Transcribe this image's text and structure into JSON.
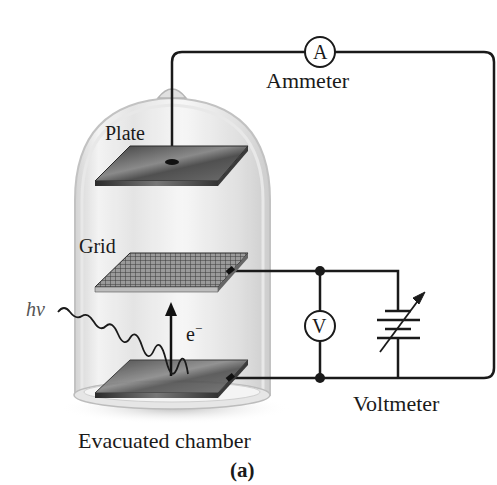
{
  "figure": {
    "caption": "(a)",
    "labels": {
      "ammeter": "Ammeter",
      "ammeter_symbol": "A",
      "plate": "Plate",
      "grid": "Grid",
      "photon": "hν",
      "electron": "e",
      "electron_charge": "−",
      "voltmeter": "Voltmeter",
      "voltmeter_symbol": "V",
      "chamber": "Evacuated chamber"
    },
    "colors": {
      "wire": "#1a1a1a",
      "glass": "#d9d9d9",
      "plate": "#5a5a5a",
      "grid": "#7a7a7a"
    }
  }
}
